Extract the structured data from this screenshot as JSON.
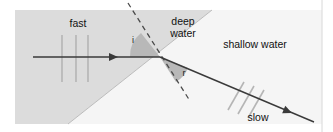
{
  "figure": {
    "name": "wave-refraction-diagram",
    "width": 333,
    "height": 132
  },
  "colors": {
    "page_background": "#ffffff",
    "deep_water_fill": "#dcdcdc",
    "shallow_water_fill": "#f5f5f5",
    "angle_wedge_fill": "#b8b8b8",
    "ray_stroke": "#3a3a3a",
    "wavefront_stroke": "#b5b5b5",
    "normal_dash_stroke": "#4a4a4a",
    "panel_border": "#d8d8d8",
    "label_text": "#111111"
  },
  "panel": {
    "x": 15,
    "y": 10,
    "width": 307,
    "height": 114
  },
  "regions": [
    {
      "id": "deep-water",
      "label": "deep water",
      "label_line_1": "deep",
      "label_line_2": "water",
      "label_x": 183,
      "label_y_1": 22,
      "label_y_2": 34,
      "fill": "#dcdcdc",
      "polygon": "15,10 212,10 68,124 15,124"
    },
    {
      "id": "shallow-water",
      "label": "shallow water",
      "label_x": 255,
      "label_y": 45,
      "fill": "#f5f5f5",
      "polygon": "212,10 322,10 322,124 68,124"
    }
  ],
  "boundary": {
    "name": "deep-shallow-boundary",
    "x1": 212,
    "y1": 10,
    "x2": 68,
    "y2": 124
  },
  "incident": {
    "label": "fast",
    "label_x": 78,
    "label_y": 24,
    "ray_x1": 33,
    "ray_y1": 57,
    "ray_x2": 160,
    "ray_y2": 57,
    "arrow_x": 118,
    "arrow_y": 57,
    "wavefronts": [
      {
        "x1": 62,
        "y1": 35,
        "x2": 62,
        "y2": 82
      },
      {
        "x1": 76,
        "y1": 35,
        "x2": 76,
        "y2": 82
      },
      {
        "x1": 88,
        "y1": 35,
        "x2": 88,
        "y2": 82
      }
    ]
  },
  "refracted": {
    "label": "slow",
    "label_x": 258,
    "label_y": 118,
    "ray_x1": 160,
    "ray_y1": 57,
    "ray_x2": 314,
    "ray_y2": 122,
    "arrow_x": 292,
    "arrow_y": 113,
    "wavefronts": [
      {
        "x1": 228,
        "y1": 110,
        "x2": 244,
        "y2": 82
      },
      {
        "x1": 238,
        "y1": 114,
        "x2": 254,
        "y2": 86
      },
      {
        "x1": 248,
        "y1": 118,
        "x2": 264,
        "y2": 90
      }
    ]
  },
  "normal_line": {
    "name": "normal-to-boundary",
    "x1": 128,
    "y1": 3,
    "x2": 190,
    "y2": 101,
    "dash_pattern": "5,4"
  },
  "intersection_point": {
    "x": 160,
    "y": 57
  },
  "angles": [
    {
      "id": "angle-of-incidence",
      "label": "i",
      "label_x": 133,
      "label_y": 41,
      "wedge_path": "M160,57 L130,57 A30,30 0 0,1 141,33 Z"
    },
    {
      "id": "angle-of-refraction",
      "label": "r",
      "label_x": 184,
      "label_y": 74,
      "wedge_path": "M160,57 L176,82 A29,29 0 0,0 188,68 Z"
    }
  ]
}
